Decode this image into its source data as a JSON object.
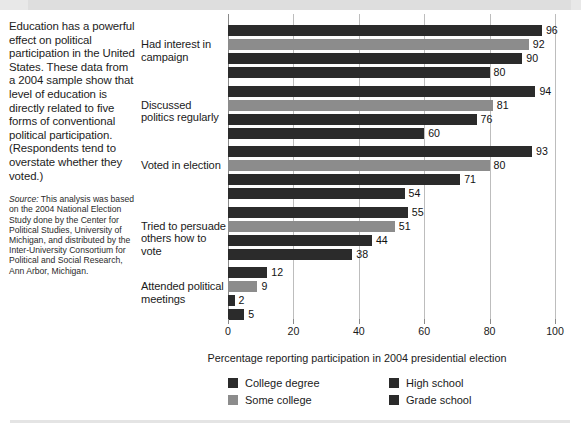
{
  "caption": {
    "body": "Education has a powerful effect on political participation in the United States. These data from a 2004 sample show that level of education is directly related to five forms of conventional political participation. (Respondents tend to overstate whether they voted.)",
    "source_lead": "Source:",
    "source_text": " This analysis was based on the 2004 National Election Study done by the Center for Political Studies, University of Michigan, and distributed by the Inter-University Consortium for Political and Social Research, Ann Arbor, Michigan."
  },
  "chart_data": {
    "type": "bar",
    "orientation": "horizontal",
    "title": "",
    "xlabel": "Percentage reporting participation in 2004 presidential election",
    "ylabel": "",
    "xlim": [
      0,
      100
    ],
    "xticks": [
      0,
      20,
      40,
      60,
      80,
      100
    ],
    "grid": true,
    "legend_position": "bottom",
    "categories": [
      "Had interest in campaign",
      "Discussed politics regularly",
      "Voted in election",
      "Tried to persuade others how to vote",
      "Attended political meetings"
    ],
    "series": [
      {
        "name": "College degree",
        "color": "#2b2b2b",
        "values": [
          96,
          94,
          93,
          55,
          12
        ]
      },
      {
        "name": "Some college",
        "color": "#8c8c8c",
        "values": [
          92,
          81,
          80,
          51,
          9
        ]
      },
      {
        "name": "High school",
        "color": "#2b2b2b",
        "values": [
          90,
          76,
          71,
          44,
          2
        ]
      },
      {
        "name": "Grade school",
        "color": "#2b2b2b",
        "values": [
          80,
          60,
          54,
          38,
          5
        ]
      }
    ]
  },
  "legend": [
    {
      "label": "College degree",
      "color": "#2b2b2b"
    },
    {
      "label": "Some college",
      "color": "#8c8c8c"
    },
    {
      "label": "High school",
      "color": "#2b2b2b"
    },
    {
      "label": "Grade school",
      "color": "#2b2b2b"
    }
  ]
}
